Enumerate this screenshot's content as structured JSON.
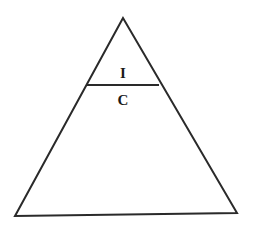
{
  "diagram": {
    "type": "triangle-divided",
    "stroke_color": "#2a2a2a",
    "background": "#ffffff",
    "triangle": {
      "apex": [
        123,
        18
      ],
      "bottom_left": [
        15,
        216
      ],
      "bottom_right": [
        237,
        213
      ]
    },
    "divider": {
      "from": [
        87,
        85
      ],
      "to": [
        159,
        85
      ]
    },
    "labels": {
      "top": {
        "text": "I",
        "position": [
          123,
          78
        ]
      },
      "bottom": {
        "text": "C",
        "position": [
          123,
          105
        ]
      }
    }
  }
}
